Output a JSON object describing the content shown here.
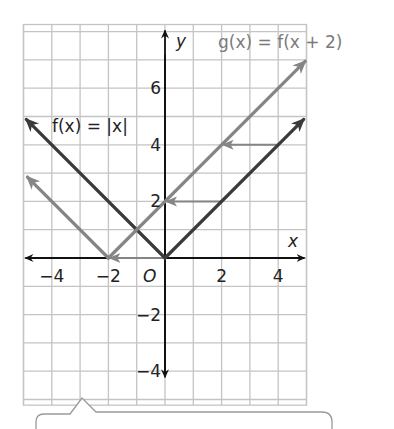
{
  "chart_data": {
    "type": "line",
    "title": "",
    "xlabel": "x",
    "ylabel": "y",
    "origin_label": "O",
    "xlim": [
      -5,
      5
    ],
    "ylim": [
      -5.2,
      8.25
    ],
    "grid": true,
    "x_tick_labels": [
      "-4",
      "-2",
      "2",
      "4"
    ],
    "x_ticks": [
      -4,
      -2,
      2,
      4
    ],
    "y_tick_labels": [
      "6",
      "4",
      "2",
      "-2",
      "-4"
    ],
    "y_ticks": [
      6,
      4,
      2,
      -2,
      -4
    ],
    "series": [
      {
        "name": "f(x) = |x|",
        "label_text": "f(x) = |x|",
        "color": "#3a3a3a",
        "points": [
          [
            -4.9,
            4.9
          ],
          [
            0,
            0
          ],
          [
            4.9,
            4.9
          ]
        ]
      },
      {
        "name": "g(x) = f(x + 2)",
        "label_text": "g(x) = f(x + 2)",
        "color": "#858585",
        "points": [
          [
            -4.86,
            2.86
          ],
          [
            -2,
            0
          ],
          [
            4.95,
            6.95
          ]
        ]
      }
    ],
    "annotations": [
      {
        "type": "translation-arrow",
        "from": [
          4,
          4
        ],
        "to": [
          2,
          4
        ]
      },
      {
        "type": "translation-arrow",
        "from": [
          2,
          2
        ],
        "to": [
          0,
          2
        ]
      },
      {
        "type": "translation-arrow",
        "from": [
          0,
          0
        ],
        "to": [
          -2,
          0
        ]
      }
    ]
  },
  "labels": {
    "f_label": "f(x) = |x|",
    "g_label": "g(x) = f(x + 2)",
    "x_axis": "x",
    "y_axis": "y",
    "origin": "O"
  },
  "callout": {
    "text": ""
  },
  "colors": {
    "grid": "#c4c4c4",
    "axis": "#111111",
    "f_line": "#3a3a3a",
    "g_line": "#858585",
    "shift_arrow": "#858585"
  }
}
